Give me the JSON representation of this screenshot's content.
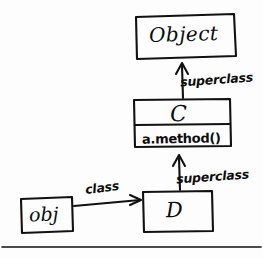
{
  "diagram": {
    "style": "hand-drawn whiteboard sketch",
    "ink_color": "#111111",
    "background_color": "#fdfdfd",
    "nodes": [
      {
        "id": "object",
        "name": "Object",
        "kind": "class-box",
        "compartments": [
          "Object"
        ]
      },
      {
        "id": "c",
        "name": "C",
        "kind": "class-box",
        "compartments": [
          "C",
          "a.method()"
        ],
        "method": "a.method()"
      },
      {
        "id": "d",
        "name": "D",
        "kind": "class-box",
        "compartments": [
          "D"
        ]
      },
      {
        "id": "obj",
        "name": "obj",
        "kind": "instance-box",
        "compartments": [
          "obj"
        ]
      }
    ],
    "edges": [
      {
        "id": "c-to-object",
        "from": "c",
        "to": "object",
        "label": "superclass",
        "direction": "up"
      },
      {
        "id": "d-to-c",
        "from": "d",
        "to": "c",
        "label": "superclass",
        "direction": "up"
      },
      {
        "id": "obj-to-d",
        "from": "obj",
        "to": "d",
        "label": "class",
        "direction": "right"
      }
    ],
    "footer_rule": true
  }
}
